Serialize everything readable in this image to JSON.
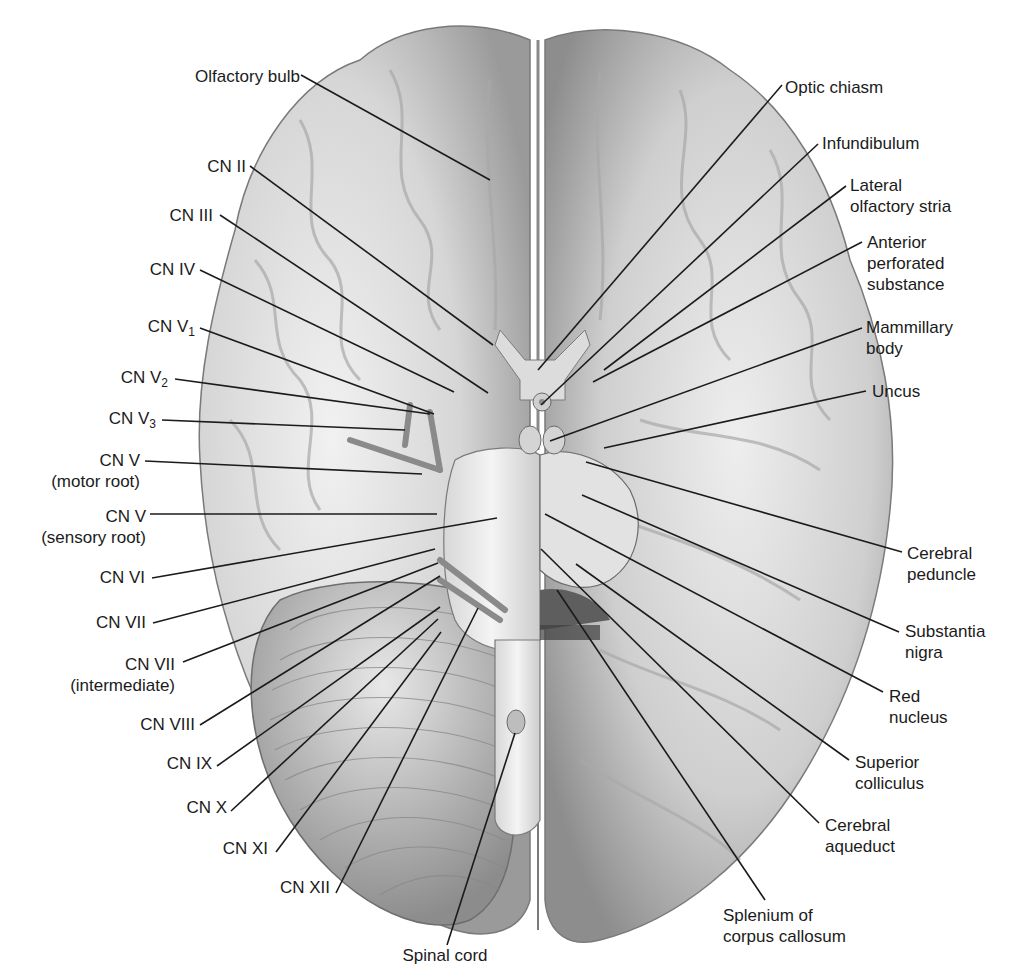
{
  "figure": {
    "colors": {
      "line": "#1b1b1b",
      "brain_light": "#e6e6e6",
      "brain_mid": "#bdbdbd",
      "brain_dark": "#8a8a8a",
      "background": "#ffffff"
    }
  },
  "labels_left": [
    {
      "id": "olfactory-bulb",
      "text": "Olfactory bulb",
      "sub": "",
      "line2": "",
      "x": 160,
      "y": 66,
      "w": 140,
      "tx": 490,
      "ty": 180,
      "lx": 301,
      "ly": 75
    },
    {
      "id": "cn-ii",
      "text": "CN II",
      "sub": "",
      "line2": "",
      "x": 180,
      "y": 156,
      "w": 66,
      "tx": 493,
      "ty": 345,
      "lx": 250,
      "ly": 166
    },
    {
      "id": "cn-iii",
      "text": "CN III",
      "sub": "",
      "line2": "",
      "x": 140,
      "y": 205,
      "w": 73,
      "tx": 488,
      "ty": 393,
      "lx": 220,
      "ly": 215
    },
    {
      "id": "cn-iv",
      "text": "CN IV",
      "sub": "",
      "line2": "",
      "x": 120,
      "y": 259,
      "w": 75,
      "tx": 454,
      "ty": 392,
      "lx": 200,
      "ly": 270
    },
    {
      "id": "cn-v1",
      "text": "CN V",
      "sub": "1",
      "line2": "",
      "x": 110,
      "y": 316,
      "w": 85,
      "tx": 434,
      "ty": 414,
      "lx": 200,
      "ly": 328
    },
    {
      "id": "cn-v2",
      "text": "CN V",
      "sub": "2",
      "line2": "",
      "x": 100,
      "y": 367,
      "w": 68,
      "tx": 430,
      "ty": 414,
      "lx": 175,
      "ly": 379
    },
    {
      "id": "cn-v3",
      "text": "CN V",
      "sub": "3",
      "line2": "",
      "x": 90,
      "y": 408,
      "w": 66,
      "tx": 405,
      "ty": 430,
      "lx": 162,
      "ly": 420
    },
    {
      "id": "cn-v-motor",
      "text": "CN V",
      "sub": "",
      "line2": "(motor root)",
      "x": 32,
      "y": 450,
      "w": 108,
      "tx": 422,
      "ty": 474,
      "lx": 145,
      "ly": 461
    },
    {
      "id": "cn-v-sensory",
      "text": "CN V",
      "sub": "",
      "line2": "(sensory root)",
      "x": 18,
      "y": 506,
      "w": 128,
      "tx": 437,
      "ty": 514,
      "lx": 150,
      "ly": 514
    },
    {
      "id": "cn-vi",
      "text": "CN VI",
      "sub": "",
      "line2": "",
      "x": 80,
      "y": 567,
      "w": 65,
      "tx": 497,
      "ty": 518,
      "lx": 152,
      "ly": 578
    },
    {
      "id": "cn-vii",
      "text": "CN VII",
      "sub": "",
      "line2": "",
      "x": 80,
      "y": 612,
      "w": 66,
      "tx": 435,
      "ty": 549,
      "lx": 153,
      "ly": 623
    },
    {
      "id": "cn-vii-int",
      "text": "CN VII",
      "sub": "",
      "line2": "(intermediate)",
      "x": 45,
      "y": 654,
      "w": 130,
      "tx": 438,
      "ty": 563,
      "lx": 183,
      "ly": 662
    },
    {
      "id": "cn-viii",
      "text": "CN VIII",
      "sub": "",
      "line2": "",
      "x": 120,
      "y": 714,
      "w": 75,
      "tx": 440,
      "ty": 576,
      "lx": 200,
      "ly": 725
    },
    {
      "id": "cn-ix",
      "text": "CN IX",
      "sub": "",
      "line2": "",
      "x": 150,
      "y": 753,
      "w": 62,
      "tx": 440,
      "ty": 607,
      "lx": 217,
      "ly": 766
    },
    {
      "id": "cn-x",
      "text": "CN X",
      "sub": "",
      "line2": "",
      "x": 175,
      "y": 797,
      "w": 52,
      "tx": 438,
      "ty": 619,
      "lx": 231,
      "ly": 811
    },
    {
      "id": "cn-xi",
      "text": "CN XI",
      "sub": "",
      "line2": "",
      "x": 208,
      "y": 838,
      "w": 60,
      "tx": 441,
      "ty": 632,
      "lx": 276,
      "ly": 852
    },
    {
      "id": "cn-xii",
      "text": "CN XII",
      "sub": "",
      "line2": "",
      "x": 270,
      "y": 877,
      "w": 60,
      "tx": 478,
      "ty": 608,
      "lx": 336,
      "ly": 893
    },
    {
      "id": "spinal-cord",
      "text": "Spinal cord",
      "sub": "",
      "line2": "",
      "x": 390,
      "y": 945,
      "w": 110,
      "tx": 515,
      "ty": 733,
      "lx": 447,
      "ly": 945
    }
  ],
  "labels_right": [
    {
      "id": "optic-chiasm",
      "text": "Optic chiasm",
      "line2": "",
      "line3": "",
      "x": 785,
      "y": 77,
      "tx": 538,
      "ty": 370,
      "lx": 782,
      "ly": 85
    },
    {
      "id": "infundibulum",
      "text": "Infundibulum",
      "line2": "",
      "line3": "",
      "x": 822,
      "y": 133,
      "tx": 541,
      "ty": 405,
      "lx": 818,
      "ly": 144
    },
    {
      "id": "lateral-olfactory-stria",
      "text": "Lateral",
      "line2": "olfactory stria",
      "line3": "",
      "x": 850,
      "y": 175,
      "tx": 604,
      "ty": 370,
      "lx": 846,
      "ly": 186
    },
    {
      "id": "anterior-perforated-substance",
      "text": "Anterior",
      "line2": "perforated",
      "line3": "substance",
      "x": 867,
      "y": 232,
      "tx": 593,
      "ty": 382,
      "lx": 862,
      "ly": 242
    },
    {
      "id": "mammillary-body",
      "text": "Mammillary",
      "line2": "body",
      "line3": "",
      "x": 866,
      "y": 317,
      "tx": 550,
      "ty": 441,
      "lx": 862,
      "ly": 328
    },
    {
      "id": "uncus",
      "text": "Uncus",
      "line2": "",
      "line3": "",
      "x": 872,
      "y": 381,
      "tx": 604,
      "ty": 448,
      "lx": 866,
      "ly": 391
    },
    {
      "id": "cerebral-peduncle",
      "text": "Cerebral",
      "line2": "peduncle",
      "line3": "",
      "x": 907,
      "y": 543,
      "tx": 586,
      "ty": 462,
      "lx": 902,
      "ly": 552
    },
    {
      "id": "substantia-nigra",
      "text": "Substantia",
      "line2": "nigra",
      "line3": "",
      "x": 905,
      "y": 621,
      "tx": 582,
      "ty": 495,
      "lx": 899,
      "ly": 632
    },
    {
      "id": "red-nucleus",
      "text": "Red",
      "line2": "nucleus",
      "line3": "",
      "x": 889,
      "y": 686,
      "tx": 545,
      "ty": 514,
      "lx": 883,
      "ly": 692
    },
    {
      "id": "superior-colliculus",
      "text": "Superior",
      "line2": "colliculus",
      "line3": "",
      "x": 855,
      "y": 752,
      "tx": 576,
      "ty": 564,
      "lx": 849,
      "ly": 760
    },
    {
      "id": "cerebral-aqueduct",
      "text": "Cerebral",
      "line2": "aqueduct",
      "line3": "",
      "x": 825,
      "y": 815,
      "tx": 541,
      "ty": 549,
      "lx": 819,
      "ly": 823
    },
    {
      "id": "splenium",
      "text": "Splenium of",
      "line2": "corpus callosum",
      "line3": "",
      "x": 723,
      "y": 905,
      "tx": 557,
      "ty": 590,
      "lx": 765,
      "ly": 900
    }
  ]
}
